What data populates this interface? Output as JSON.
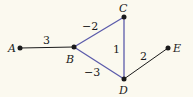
{
  "diagram": {
    "type": "weighted-graph",
    "colors": {
      "background": "#fbf9ef",
      "default_edge": "#1a1a1a",
      "highlight_edge": "#5b5bab",
      "node": "#1a1a1a"
    },
    "nodes": [
      {
        "id": "A",
        "label": "A",
        "x": 20,
        "y": 48
      },
      {
        "id": "B",
        "label": "B",
        "x": 74,
        "y": 47
      },
      {
        "id": "C",
        "label": "C",
        "x": 124,
        "y": 17
      },
      {
        "id": "D",
        "label": "D",
        "x": 124,
        "y": 79
      },
      {
        "id": "E",
        "label": "E",
        "x": 168,
        "y": 48
      }
    ],
    "edges": [
      {
        "from": "A",
        "to": "B",
        "weight": "3",
        "highlighted": false
      },
      {
        "from": "B",
        "to": "C",
        "weight": "−2",
        "highlighted": true
      },
      {
        "from": "B",
        "to": "D",
        "weight": "−3",
        "highlighted": true
      },
      {
        "from": "C",
        "to": "D",
        "weight": "1",
        "highlighted": true
      },
      {
        "from": "D",
        "to": "E",
        "weight": "2",
        "highlighted": false
      }
    ]
  }
}
